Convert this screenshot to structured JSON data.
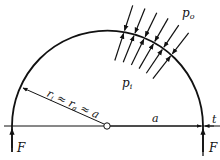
{
  "diagram": {
    "labels": {
      "outer_pressure": "p",
      "outer_pressure_sub": "o",
      "inner_pressure": "p",
      "inner_pressure_sub": "i",
      "radius_relation_r1": "r",
      "radius_relation_r1_sub": "i",
      "radius_relation_approx1": " ≈ ",
      "radius_relation_r2": "r",
      "radius_relation_r2_sub": "a",
      "radius_relation_approx2": " ≈ ",
      "radius_relation_a": "a",
      "half_span": "a",
      "thickness": "t",
      "force_left": "F",
      "force_right": "F"
    },
    "pressure_arrow_count": 6,
    "colors": {
      "stroke": "#111111",
      "background": "#ffffff"
    }
  }
}
